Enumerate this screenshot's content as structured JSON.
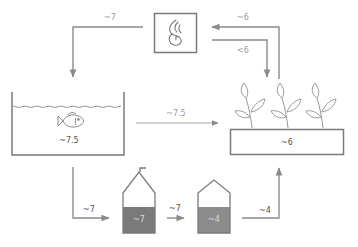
{
  "diagram": {
    "type": "aquaponics-ph-flow",
    "colors": {
      "line": "#8a8a8a",
      "outline": "#7a7a7a",
      "tank1_fill": "#7a7a7a",
      "tank2_fill": "#8c8c8c",
      "label": "#9a9a9a"
    },
    "nodes": {
      "heater": {
        "icon": "flame-icon"
      },
      "fish_tank": {
        "icon": "fish-icon",
        "value": "~7.5"
      },
      "grow_bed": {
        "icon": "plants-icon",
        "value": "~6"
      },
      "tank1": {
        "value": "~7"
      },
      "tank2": {
        "value": "~4"
      }
    },
    "edges": [
      {
        "from": "heater",
        "to": "fish_tank",
        "label": "~7"
      },
      {
        "from": "grow_bed",
        "to": "heater",
        "label": "~6"
      },
      {
        "from": "heater",
        "to": "grow_bed",
        "label": "<6"
      },
      {
        "from": "fish_tank",
        "to": "grow_bed",
        "label": "~7.5"
      },
      {
        "from": "fish_tank",
        "to": "tank1",
        "label": "~7"
      },
      {
        "from": "tank1",
        "to": "tank2",
        "label": "~7"
      },
      {
        "from": "tank2",
        "to": "grow_bed",
        "label": "~4"
      }
    ]
  }
}
